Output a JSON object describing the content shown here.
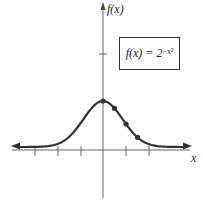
{
  "chart_data": {
    "type": "line",
    "title": "",
    "xlabel": "x",
    "ylabel": "f(x)",
    "legend": [
      "f(x) = 2^(-x^2)"
    ],
    "function": "f(x) = 2^(-x^2)",
    "xlim": [
      -4,
      4
    ],
    "ylim": [
      -1,
      3
    ],
    "x_ticks": [
      -3,
      -2,
      -1,
      1,
      2
    ],
    "y_ticks": [
      2
    ],
    "grid": false,
    "legend_position": "upper right (boxed)",
    "series": [
      {
        "name": "f(x) = 2^(-x^2)",
        "x": [
          -4,
          -3,
          -2,
          -1.5,
          -1,
          -0.5,
          0,
          0.5,
          1,
          1.5,
          2,
          3,
          4
        ],
        "values": [
          1.53e-05,
          0.00195,
          0.0625,
          0.21,
          0.5,
          0.84,
          1,
          0.84,
          0.5,
          0.21,
          0.0625,
          0.00195,
          1.53e-05
        ]
      }
    ],
    "highlighted_points": [
      {
        "x": 0,
        "y": 1
      },
      {
        "x": 0.5,
        "y": 0.84
      },
      {
        "x": 1,
        "y": 0.5
      },
      {
        "x": 1.5,
        "y": 0.21
      }
    ]
  },
  "labels": {
    "y_axis": "f(x)",
    "x_axis": "x",
    "legend_fx": "f(x) = 2",
    "legend_exp": "−x²"
  },
  "colors": {
    "curve": "#333333",
    "axis": "#555555",
    "background": "#ffffff"
  }
}
